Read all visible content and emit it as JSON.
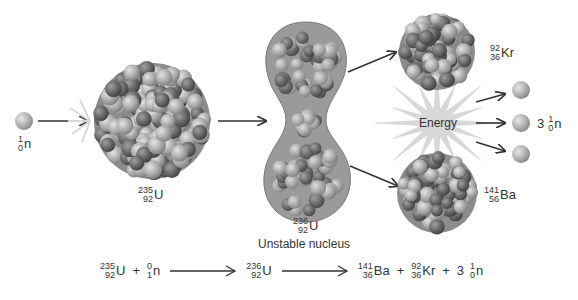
{
  "diagram": {
    "incoming_neutron": {
      "mass": "1",
      "atomic": "0",
      "symbol": "n"
    },
    "uranium_235": {
      "mass": "235",
      "atomic": "92",
      "symbol": "U"
    },
    "uranium_236": {
      "mass": "236",
      "atomic": "92",
      "symbol": "U",
      "caption": "Unstable nucleus"
    },
    "krypton": {
      "mass": "92",
      "atomic": "36",
      "symbol": "Kr"
    },
    "barium": {
      "mass": "141",
      "atomic": "56",
      "symbol": "Ba"
    },
    "energy_label": "Energy",
    "released_neutrons": {
      "count": "3",
      "mass": "1",
      "atomic": "0",
      "symbol": "n"
    }
  },
  "equation": {
    "reactant1": {
      "mass": "235",
      "atomic": "92",
      "symbol": "U"
    },
    "plus1": "+",
    "reactant2": {
      "top": "0",
      "bottom": "1",
      "symbol": "n"
    },
    "intermediate": {
      "mass": "236",
      "atomic": "92",
      "symbol": "U"
    },
    "product1": {
      "mass": "141",
      "atomic": "36",
      "symbol": "Ba"
    },
    "plus2": "+",
    "product2": {
      "mass": "92",
      "atomic": "36",
      "symbol": "Kr"
    },
    "plus3": "+",
    "product3_count": "3",
    "product3": {
      "mass": "1",
      "atomic": "0",
      "symbol": "n"
    }
  },
  "colors": {
    "nucleon_light": "#b8b8b8",
    "nucleon_dark": "#6e6e6e",
    "energy_star": "#d6d6d6",
    "arrow": "#333333"
  }
}
